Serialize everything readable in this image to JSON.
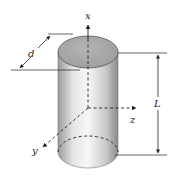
{
  "diagram": {
    "type": "cylinder-coordinate-figure",
    "labels": {
      "x_axis": "x",
      "y_axis": "y",
      "z_axis": "z",
      "diameter": "d",
      "length": "L"
    },
    "colors": {
      "top_face": "#a9a9a9",
      "body_light": "#f2f2f2",
      "body_dark": "#8f8f8f",
      "line": "#222222"
    }
  }
}
